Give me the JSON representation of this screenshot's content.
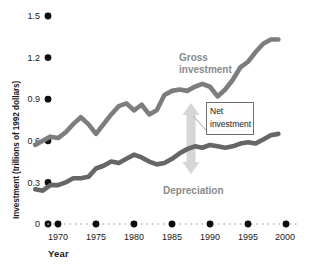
{
  "chart_data": {
    "type": "line",
    "title": "",
    "xlabel": "Year",
    "ylabel": "Investment (trillions of 1992 dollars)",
    "xlim": [
      1967,
      2000.5
    ],
    "ylim": [
      0,
      1.5
    ],
    "xticks": [
      1970,
      1975,
      1980,
      1985,
      1990,
      1995,
      2000
    ],
    "xtick_labels": [
      "1970",
      "1975",
      "1980",
      "1985",
      "1990",
      "1995",
      "2000"
    ],
    "yticks": [
      0,
      0.3,
      0.6,
      0.9,
      1.2,
      1.5
    ],
    "ytick_labels": [
      "0",
      "0.3",
      "0.6",
      "0.9",
      "1.2",
      "1.5"
    ],
    "grid": false,
    "legend_position": "inline-annotations",
    "series": [
      {
        "name": "Gross investment",
        "color": "#7d7d7d",
        "x": [
          1967,
          1968,
          1969,
          1970,
          1971,
          1972,
          1973,
          1974,
          1975,
          1976,
          1977,
          1978,
          1979,
          1980,
          1981,
          1982,
          1983,
          1984,
          1985,
          1986,
          1987,
          1988,
          1989,
          1990,
          1991,
          1992,
          1993,
          1994,
          1995,
          1996,
          1997,
          1998,
          1999
        ],
        "values": [
          0.57,
          0.6,
          0.63,
          0.62,
          0.66,
          0.72,
          0.77,
          0.72,
          0.65,
          0.72,
          0.79,
          0.85,
          0.87,
          0.82,
          0.86,
          0.79,
          0.82,
          0.93,
          0.96,
          0.97,
          0.96,
          0.99,
          1.01,
          0.99,
          0.92,
          0.97,
          1.04,
          1.13,
          1.17,
          1.24,
          1.3,
          1.33,
          1.33
        ]
      },
      {
        "name": "Depreciation",
        "color": "#666666",
        "x": [
          1967,
          1968,
          1969,
          1970,
          1971,
          1972,
          1973,
          1974,
          1975,
          1976,
          1977,
          1978,
          1979,
          1980,
          1981,
          1982,
          1983,
          1984,
          1985,
          1986,
          1987,
          1988,
          1989,
          1990,
          1991,
          1992,
          1993,
          1994,
          1995,
          1996,
          1997,
          1998,
          1999
        ],
        "values": [
          0.25,
          0.24,
          0.28,
          0.28,
          0.3,
          0.33,
          0.33,
          0.34,
          0.4,
          0.42,
          0.45,
          0.44,
          0.47,
          0.5,
          0.48,
          0.45,
          0.43,
          0.44,
          0.47,
          0.51,
          0.54,
          0.56,
          0.55,
          0.57,
          0.56,
          0.55,
          0.56,
          0.58,
          0.59,
          0.58,
          0.61,
          0.64,
          0.65
        ]
      }
    ],
    "annotations": [
      {
        "name": "gross-investment-label",
        "text": "Gross\ninvestment",
        "x_px": 179,
        "y_px": 58
      },
      {
        "name": "depreciation-label",
        "text": "Depreciation",
        "x_px": 163,
        "y_px": 190
      },
      {
        "name": "net-investment-callout",
        "text": "Net\ninvestment"
      }
    ],
    "net_investment_arrow": {
      "name": "net-investment-arrow",
      "description": "vertical double-headed arrow between Depreciation and Gross investment curves",
      "color": "#d4d4d4",
      "x_px": 191,
      "y_top_px": 104,
      "y_bottom_px": 172
    }
  },
  "axis": {
    "y_title": "Investment (trillions of 1992 dollars)",
    "x_title": "Year"
  }
}
